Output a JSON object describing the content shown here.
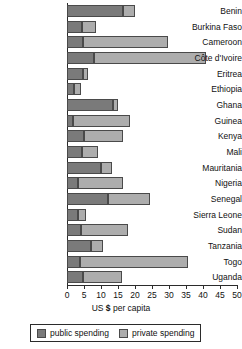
{
  "chart_data": {
    "type": "bar",
    "orientation": "horizontal",
    "stacked": true,
    "title": "",
    "xlabel": "US $ per capita",
    "ylabel": "",
    "xlim": [
      0,
      50
    ],
    "xticks": [
      0,
      5,
      10,
      15,
      20,
      25,
      30,
      35,
      40,
      45,
      50
    ],
    "xtick_labels": [
      "0",
      "5",
      "10",
      "15",
      "20",
      "25",
      "30",
      "35",
      "40",
      "45",
      "50"
    ],
    "grid": false,
    "legend_position": "bottom",
    "categories": [
      "Benin",
      "Burkina Faso",
      "Cameroon",
      "Côte d'Ivoire",
      "Eritrea",
      "Ethiopia",
      "Ghana",
      "Guinea",
      "Kenya",
      "Mali",
      "Mauritania",
      "Nigeria",
      "Senegal",
      "Sierra Leone",
      "Sudan",
      "Tanzania",
      "Togo",
      "Uganda"
    ],
    "series": [
      {
        "name": "public spending",
        "color": "#7a7a7a",
        "values": [
          16.5,
          4.5,
          4.8,
          8.0,
          4.8,
          2.1,
          13.6,
          1.8,
          5.0,
          4.5,
          10.0,
          3.3,
          12.1,
          3.3,
          4.0,
          7.0,
          3.9,
          4.8
        ]
      },
      {
        "name": "private spending",
        "color": "#adadad",
        "values": [
          3.6,
          4.0,
          25.0,
          33.0,
          1.5,
          1.9,
          1.5,
          16.8,
          11.5,
          4.5,
          3.3,
          13.3,
          12.3,
          2.4,
          13.8,
          3.5,
          31.6,
          11.5
        ]
      }
    ],
    "totals": [
      20.1,
      8.5,
      29.8,
      41.0,
      6.3,
      4.0,
      15.1,
      18.6,
      16.5,
      9.0,
      13.3,
      16.6,
      24.4,
      5.7,
      17.8,
      10.5,
      35.5,
      16.3
    ]
  },
  "legend": {
    "items": [
      {
        "label": "public spending",
        "color": "#7a7a7a"
      },
      {
        "label": "private spending",
        "color": "#adadad"
      }
    ]
  },
  "axis": {
    "x_title_prefix": "US ",
    "x_title_dollar": "$",
    "x_title_suffix": " per capita"
  }
}
